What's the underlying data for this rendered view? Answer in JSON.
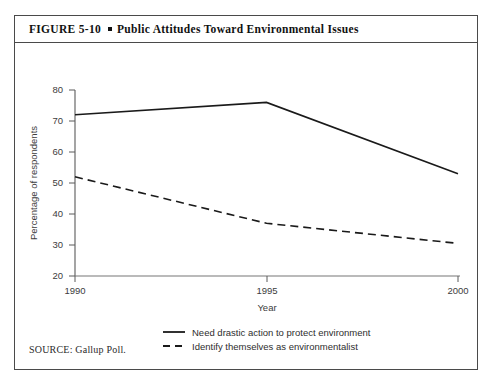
{
  "figure": {
    "number_label": "FIGURE  5-10",
    "bullet": "square-bullet",
    "title": "Public Attitudes Toward Environmental Issues",
    "source": "SOURCE: Gallup Poll."
  },
  "chart_data": {
    "type": "line",
    "title": "Public Attitudes Toward Environmental Issues",
    "xlabel": "Year",
    "ylabel": "Percentage of respondents",
    "x": [
      1990,
      1995,
      2000
    ],
    "xtick_labels": [
      "1990",
      "1995",
      "2000"
    ],
    "ytick_labels": [
      "20",
      "30",
      "40",
      "50",
      "60",
      "70",
      "80"
    ],
    "yticks": [
      20,
      30,
      40,
      50,
      60,
      70,
      80
    ],
    "ylim": [
      20,
      80
    ],
    "xlim": [
      1990,
      2000
    ],
    "grid": false,
    "legend_position": "below-plot",
    "series": [
      {
        "name": "Need drastic action to protect environment",
        "style": "solid",
        "color": "#1a1a1a",
        "values": [
          72,
          76,
          53
        ]
      },
      {
        "name": "Identify themselves as environmentalist",
        "style": "dashed",
        "color": "#1a1a1a",
        "values": [
          52,
          37,
          30.5
        ]
      }
    ]
  },
  "legend": {
    "items": [
      {
        "label": "Need drastic action to protect environment",
        "marker": "solid-line-swatch"
      },
      {
        "label": "Identify themselves as environmentalist",
        "marker": "dashed-line-swatch"
      }
    ]
  },
  "colors": {
    "border": "#4a4a4a",
    "axis": "#555555",
    "line": "#1a1a1a",
    "text": "#2b2b2b",
    "background": "#ffffff"
  }
}
